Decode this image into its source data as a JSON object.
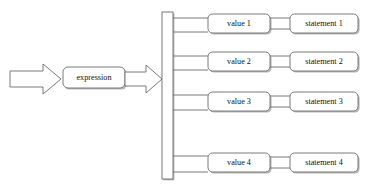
{
  "diagram": {
    "type": "switch-case-flowchart",
    "title": "",
    "input_arrow": {
      "icon": "block-arrow-right-icon",
      "label": ""
    },
    "expression_node": {
      "label": "expression",
      "shape": "rounded-rectangle"
    },
    "dispatch_arrow": {
      "icon": "block-arrow-right-icon",
      "label": ""
    },
    "dispatch_bar": {
      "label": "",
      "shape": "vertical-bar"
    },
    "branches": [
      {
        "value": "value 1",
        "statement": "statement 1"
      },
      {
        "value": "value 2",
        "statement": "statement 2"
      },
      {
        "value": "value 3",
        "statement": "statement 3"
      },
      {
        "value": "value 4",
        "statement": "statement 4"
      }
    ]
  },
  "colors": {
    "background": "#ffffff",
    "stroke": "#6b6b6b",
    "shadow": "#b9b9b9",
    "text": "#111111"
  }
}
